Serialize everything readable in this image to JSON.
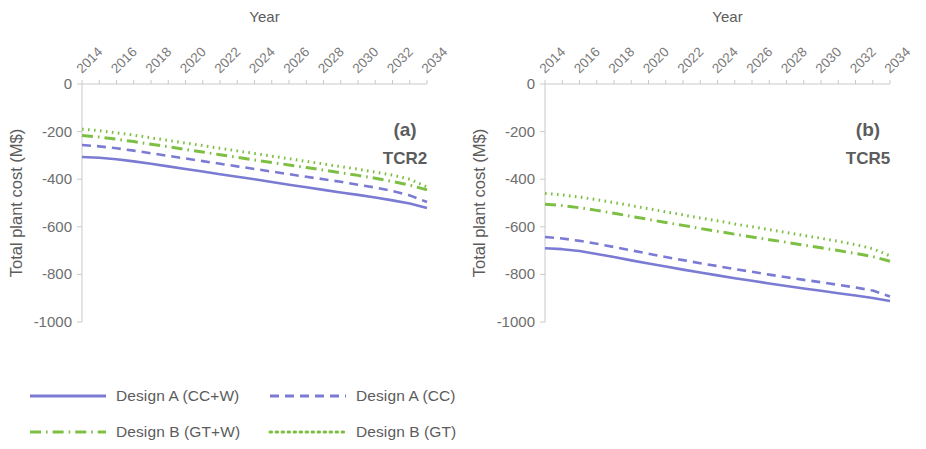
{
  "figure": {
    "panels": [
      {
        "tag": "(a)",
        "subtitle": "TCR2",
        "xlabel": "Year",
        "ylabel": "Total plant cost (M$)"
      },
      {
        "tag": "(b)",
        "subtitle": "TCR5",
        "xlabel": "Year",
        "ylabel": "Total plant cost (M$)"
      }
    ]
  },
  "legend": {
    "items": [
      {
        "label": "Design A (CC+W)",
        "style": "solid",
        "color": "#7B7BD4"
      },
      {
        "label": "Design A (CC)",
        "style": "dashed",
        "color": "#7B7BD4"
      },
      {
        "label": "Design B (GT+W)",
        "style": "dashdot",
        "color": "#7DBF43"
      },
      {
        "label": "Design B (GT)",
        "style": "dotted",
        "color": "#7DBF43"
      }
    ]
  },
  "colors": {
    "purple": "#7B7BD4",
    "green": "#7DBF43",
    "axis": "#c9c9c9",
    "text": "#5c5c5c"
  },
  "chart_data": [
    {
      "type": "line",
      "title": "(a) TCR2",
      "xlabel": "Year",
      "ylabel": "Total plant cost (M$)",
      "xlim": [
        2014,
        2034
      ],
      "ylim": [
        -1000,
        0
      ],
      "yticks": [
        0,
        -200,
        -400,
        -600,
        -800,
        -1000
      ],
      "xticks": [
        2014,
        2016,
        2018,
        2020,
        2022,
        2024,
        2026,
        2028,
        2030,
        2032,
        2034
      ],
      "xtick_labels": [
        "2014",
        "2016",
        "2018",
        "2020",
        "2022",
        "2024",
        "2026",
        "2028",
        "2030",
        "2032",
        "2034"
      ],
      "grid": false,
      "legend_position": "below-figure",
      "x": [
        2014,
        2015,
        2016,
        2017,
        2018,
        2019,
        2020,
        2021,
        2022,
        2023,
        2024,
        2025,
        2026,
        2027,
        2028,
        2029,
        2030,
        2031,
        2032,
        2033,
        2034
      ],
      "series": [
        {
          "name": "Design A (CC+W)",
          "style": "solid",
          "color": "#7B7BD4",
          "values": [
            -307,
            -310,
            -316,
            -325,
            -335,
            -346,
            -357,
            -368,
            -379,
            -390,
            -400,
            -412,
            -423,
            -434,
            -445,
            -456,
            -466,
            -477,
            -489,
            -502,
            -521
          ]
        },
        {
          "name": "Design A (CC)",
          "style": "dashed",
          "color": "#7B7BD4",
          "values": [
            -256,
            -262,
            -270,
            -280,
            -291,
            -302,
            -313,
            -324,
            -335,
            -346,
            -357,
            -368,
            -379,
            -390,
            -400,
            -411,
            -423,
            -435,
            -450,
            -468,
            -496
          ]
        },
        {
          "name": "Design B (GT+W)",
          "style": "dashdot",
          "color": "#7DBF43",
          "values": [
            -216,
            -223,
            -232,
            -242,
            -253,
            -264,
            -275,
            -286,
            -297,
            -308,
            -319,
            -330,
            -340,
            -351,
            -362,
            -373,
            -384,
            -396,
            -410,
            -425,
            -445
          ]
        },
        {
          "name": "Design B (GT)",
          "style": "dotted",
          "color": "#7DBF43",
          "values": [
            -190,
            -196,
            -205,
            -215,
            -226,
            -237,
            -248,
            -259,
            -270,
            -281,
            -292,
            -303,
            -314,
            -325,
            -336,
            -347,
            -358,
            -370,
            -383,
            -400,
            -433
          ]
        }
      ]
    },
    {
      "type": "line",
      "title": "(b) TCR5",
      "xlabel": "Year",
      "ylabel": "Total plant cost (M$)",
      "xlim": [
        2014,
        2034
      ],
      "ylim": [
        -1000,
        0
      ],
      "yticks": [
        0,
        -200,
        -400,
        -600,
        -800,
        -1000
      ],
      "xticks": [
        2014,
        2016,
        2018,
        2020,
        2022,
        2024,
        2026,
        2028,
        2030,
        2032,
        2034
      ],
      "xtick_labels": [
        "2014",
        "2016",
        "2018",
        "2020",
        "2022",
        "2024",
        "2026",
        "2028",
        "2030",
        "2032",
        "2034"
      ],
      "grid": false,
      "legend_position": "below-figure",
      "x": [
        2014,
        2015,
        2016,
        2017,
        2018,
        2019,
        2020,
        2021,
        2022,
        2023,
        2024,
        2025,
        2026,
        2027,
        2028,
        2029,
        2030,
        2031,
        2032,
        2033,
        2034
      ],
      "series": [
        {
          "name": "Design A (CC+W)",
          "style": "solid",
          "color": "#7B7BD4",
          "values": [
            -690,
            -694,
            -702,
            -714,
            -727,
            -741,
            -754,
            -767,
            -780,
            -792,
            -804,
            -816,
            -827,
            -838,
            -849,
            -859,
            -869,
            -879,
            -889,
            -899,
            -912
          ]
        },
        {
          "name": "Design A (CC)",
          "style": "dashed",
          "color": "#7B7BD4",
          "values": [
            -643,
            -649,
            -659,
            -671,
            -685,
            -699,
            -713,
            -727,
            -740,
            -753,
            -765,
            -778,
            -789,
            -801,
            -812,
            -823,
            -833,
            -844,
            -855,
            -868,
            -893
          ]
        },
        {
          "name": "Design B (GT+W)",
          "style": "dashdot",
          "color": "#7DBF43",
          "values": [
            -505,
            -511,
            -520,
            -531,
            -543,
            -556,
            -569,
            -582,
            -594,
            -607,
            -619,
            -631,
            -643,
            -654,
            -665,
            -677,
            -688,
            -700,
            -712,
            -725,
            -745
          ]
        },
        {
          "name": "Design B (GT)",
          "style": "dotted",
          "color": "#7DBF43",
          "values": [
            -460,
            -466,
            -475,
            -486,
            -498,
            -511,
            -524,
            -537,
            -550,
            -563,
            -575,
            -588,
            -600,
            -612,
            -624,
            -636,
            -648,
            -661,
            -675,
            -692,
            -722
          ]
        }
      ]
    }
  ]
}
